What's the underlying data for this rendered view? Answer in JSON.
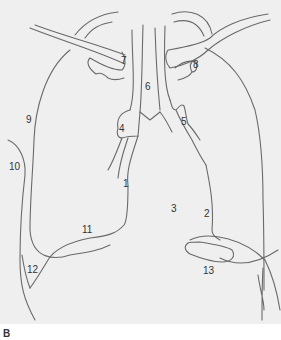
{
  "figure": {
    "panel_label": "B",
    "background_color": "#efefef",
    "line_color": "#6a6a6a",
    "labels": [
      {
        "id": "1",
        "text": "1"
      },
      {
        "id": "2",
        "text": "2"
      },
      {
        "id": "3",
        "text": "3"
      },
      {
        "id": "4",
        "text": "4"
      },
      {
        "id": "5",
        "text": "5"
      },
      {
        "id": "6",
        "text": "6"
      },
      {
        "id": "7",
        "text": "7"
      },
      {
        "id": "8",
        "text": "8"
      },
      {
        "id": "9",
        "text": "9"
      },
      {
        "id": "10",
        "text": "10"
      },
      {
        "id": "11",
        "text": "11"
      },
      {
        "id": "12",
        "text": "12"
      },
      {
        "id": "13",
        "text": "13"
      }
    ]
  }
}
